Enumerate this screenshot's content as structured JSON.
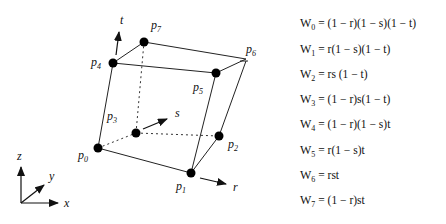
{
  "diagram": {
    "points": [
      {
        "name": "p0",
        "label": "p",
        "sub": "0",
        "x": 98,
        "y": 148
      },
      {
        "name": "p1",
        "label": "p",
        "sub": "1",
        "x": 191,
        "y": 173
      },
      {
        "name": "p2",
        "label": "p",
        "sub": "2",
        "x": 219,
        "y": 136
      },
      {
        "name": "p3",
        "label": "p",
        "sub": "3",
        "x": 136,
        "y": 133
      },
      {
        "name": "p4",
        "label": "p",
        "sub": "4",
        "x": 113,
        "y": 63
      },
      {
        "name": "p5",
        "label": "p",
        "sub": "5",
        "x": 216,
        "y": 73
      },
      {
        "name": "p6",
        "label": "p",
        "sub": "6",
        "x": 246,
        "y": 59
      },
      {
        "name": "p7",
        "label": "p",
        "sub": "7",
        "x": 144,
        "y": 42
      }
    ],
    "parametric_axes": {
      "r": "r",
      "s": "s",
      "t": "t"
    },
    "world_axes": {
      "x": "x",
      "y": "y",
      "z": "z"
    }
  },
  "formulas": [
    {
      "w": "W",
      "sub": "0",
      "expr": "= (1 − r)(1 − s)(1 − t)"
    },
    {
      "w": "W",
      "sub": "1",
      "expr": " =  r(1 − s)(1 − t)"
    },
    {
      "w": "W",
      "sub": "2",
      "expr": "= rs  (1 − t)"
    },
    {
      "w": "W",
      "sub": "3",
      "expr": " =  (1 − r)s(1 − t)"
    },
    {
      "w": "W",
      "sub": "4",
      "expr": "= (1 − r)(1 − s)t"
    },
    {
      "w": "W",
      "sub": "5",
      "expr": " =  r(1 − s)t"
    },
    {
      "w": "W",
      "sub": "6",
      "expr": " =  rst"
    },
    {
      "w": "W",
      "sub": "7",
      "expr": " =  (1 − r)st"
    }
  ]
}
